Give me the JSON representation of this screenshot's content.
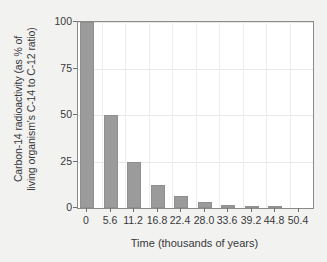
{
  "chart_data": {
    "type": "bar",
    "title": "",
    "xlabel": "Time (thousands of years)",
    "ylabel_line1": "Carbon-14 radioactivity (as % of",
    "ylabel_line2": "living organism's C-14 to C-12 ratio)",
    "categories": [
      "0",
      "5.6",
      "11.2",
      "16.8",
      "22.4",
      "28.0",
      "33.6",
      "39.2",
      "44.8",
      "50.4"
    ],
    "values": [
      100,
      50,
      25,
      12.5,
      6.25,
      3.13,
      1.56,
      0.78,
      0.39,
      0.2
    ],
    "ylim": [
      0,
      100
    ],
    "yticks": [
      "100",
      "75",
      "50",
      "25",
      "0"
    ],
    "ytick_values": [
      100,
      75,
      50,
      25,
      0
    ],
    "grid": "both",
    "legend": "none",
    "bar_color": "#9b9b9b",
    "plot_background": "#ffffff",
    "figure_background": "#f2f2f1",
    "axis_color": "#8a8a8a",
    "gridline_color": "#e8e8e8",
    "text_color": "#38383a",
    "half_life": 5.6
  }
}
